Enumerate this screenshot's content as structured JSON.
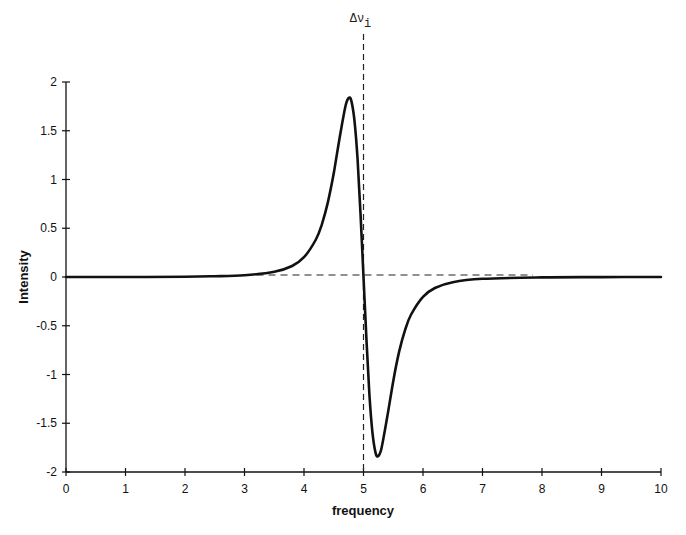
{
  "chart_data": {
    "type": "line",
    "title": "",
    "xlabel": "frequency",
    "ylabel": "Intensity",
    "xlim": [
      0,
      10
    ],
    "ylim": [
      -2,
      2
    ],
    "xticks": [
      0,
      1,
      2,
      3,
      4,
      5,
      6,
      7,
      8,
      9,
      10
    ],
    "xtick_labels": [
      "0",
      "1",
      "2",
      "3",
      "4",
      "5",
      "6",
      "7",
      "8",
      "9",
      "10"
    ],
    "yticks": [
      2,
      1.5,
      1,
      0.5,
      0,
      -0.5,
      -1,
      -1.5,
      -2
    ],
    "ytick_labels": [
      "2",
      "1.5",
      "1",
      "0.5",
      "0",
      "-0.5",
      "-1",
      "-1.5",
      "-2"
    ],
    "grid": false,
    "legend": null,
    "annotations": [
      {
        "text": "Δν",
        "subscript": "i",
        "x": 5,
        "type": "vertical-dashed-line"
      },
      {
        "type": "horizontal-dashed-line",
        "y": 0,
        "x_from": 3,
        "x_to": 7.85
      }
    ],
    "series": [
      {
        "name": "signal",
        "x": [
          0,
          1,
          2,
          2.5,
          3,
          3.5,
          3.8,
          4.0,
          4.2,
          4.3,
          4.4,
          4.5,
          4.6,
          4.7,
          4.76,
          4.8,
          4.85,
          4.9,
          4.95,
          5.0,
          5.05,
          5.1,
          5.15,
          5.2,
          5.24,
          5.3,
          5.4,
          5.5,
          5.6,
          5.7,
          5.8,
          6.0,
          6.2,
          6.5,
          7.0,
          8.0,
          9.0,
          10.0
        ],
        "values": [
          0.0,
          0.0,
          0.002,
          0.008,
          0.018,
          0.053,
          0.113,
          0.203,
          0.385,
          0.541,
          0.763,
          1.066,
          1.432,
          1.761,
          1.84,
          1.796,
          1.592,
          1.205,
          0.652,
          0.0,
          -0.652,
          -1.205,
          -1.592,
          -1.796,
          -1.84,
          -1.761,
          -1.432,
          -1.066,
          -0.763,
          -0.541,
          -0.385,
          -0.203,
          -0.113,
          -0.053,
          -0.018,
          -0.004,
          -0.001,
          0.0
        ]
      }
    ]
  }
}
